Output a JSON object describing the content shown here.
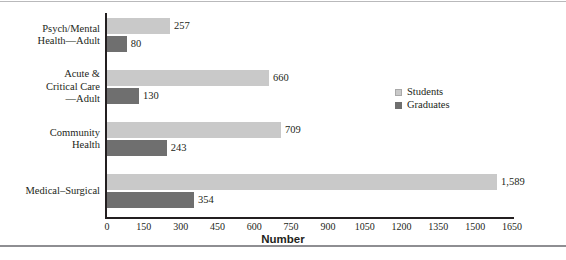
{
  "chart_data": {
    "type": "bar",
    "orientation": "horizontal",
    "title": "",
    "xlabel": "Number",
    "ylabel": "",
    "xlim": [
      0,
      1650
    ],
    "xticks": [
      0,
      150,
      300,
      450,
      600,
      750,
      900,
      1050,
      1200,
      1350,
      1500,
      1650
    ],
    "xtick_labels": [
      "0",
      "150",
      "300",
      "450",
      "600",
      "750",
      "900",
      "1050",
      "1200",
      "1350",
      "1500",
      "1650"
    ],
    "grid": false,
    "legend_position": "center-right",
    "categories": [
      "Psych/Mental Health—Adult",
      "Acute & Critical Care —Adult",
      "Community Health",
      "Medical–Surgical"
    ],
    "category_lines": [
      [
        "Psych/Mental",
        "Health—Adult"
      ],
      [
        "Acute &",
        "Critical Care",
        "—Adult"
      ],
      [
        "Community",
        "Health"
      ],
      [
        "Medical–Surgical"
      ]
    ],
    "series": [
      {
        "name": "Students",
        "color": "#c9c9c9",
        "values": [
          257,
          660,
          709,
          1589
        ],
        "value_labels": [
          "257",
          "660",
          "709",
          "1,589"
        ]
      },
      {
        "name": "Graduates",
        "color": "#6f6f6f",
        "values": [
          80,
          130,
          243,
          354
        ],
        "value_labels": [
          "80",
          "130",
          "243",
          "354"
        ]
      }
    ]
  },
  "legend": {
    "items": [
      {
        "label": "Students",
        "swatch": "students"
      },
      {
        "label": "Graduates",
        "swatch": "graduates"
      }
    ]
  },
  "axis": {
    "x_title": "Number"
  }
}
